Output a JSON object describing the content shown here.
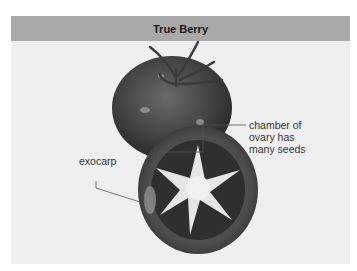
{
  "figure": {
    "title": "True Berry",
    "labels": {
      "chamber": [
        "chamber of",
        "ovary has",
        "many seeds"
      ],
      "exocarp": "exocarp"
    },
    "colors": {
      "header_bg": "#a9a9a9",
      "panel_bg": "#efefef",
      "tomato_dark": "#3a3a3a",
      "tomato_mid": "#5a5a5a",
      "flesh_light": "#e8e8e8",
      "leader_line": "#555555"
    }
  }
}
